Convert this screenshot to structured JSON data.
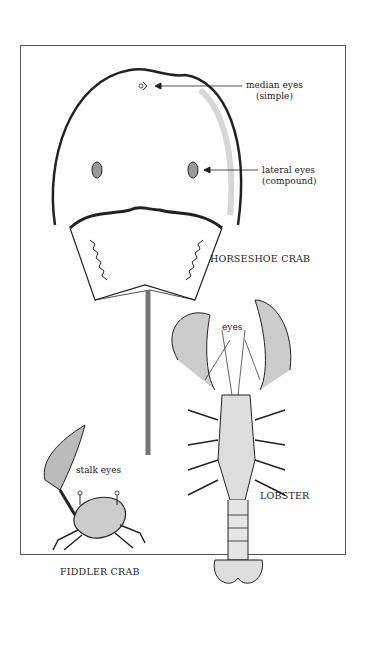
{
  "figure": {
    "specimens": [
      {
        "name": "HORSESHOE CRAB",
        "labels": [
          {
            "text": "median eyes",
            "sub": "(simple)"
          },
          {
            "text": "lateral eyes",
            "sub": "(compound)"
          }
        ]
      },
      {
        "name": "LOBSTER",
        "labels": [
          {
            "text": "eyes"
          }
        ]
      },
      {
        "name": "FIDDLER CRAB",
        "labels": [
          {
            "text": "stalk eyes"
          }
        ]
      }
    ]
  },
  "colors": {
    "ink": "#222222",
    "frame": "#555555",
    "shade": "#bbbbbb"
  }
}
